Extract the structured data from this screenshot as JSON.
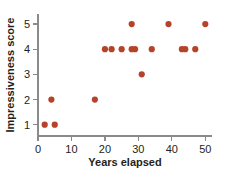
{
  "chart_data": {
    "type": "scatter",
    "title": "",
    "xlabel": "Years elapsed",
    "ylabel": "Impressiveness score",
    "xlim": [
      0,
      52
    ],
    "ylim": [
      0.55,
      5.4
    ],
    "xticks": [
      0,
      10,
      20,
      30,
      40,
      50
    ],
    "xtick_labels": [
      "0",
      "10",
      "20",
      "30",
      "40",
      "50"
    ],
    "yticks": [
      1,
      2,
      3,
      4,
      5
    ],
    "ytick_labels": [
      "1",
      "2",
      "3",
      "4",
      "5"
    ],
    "grid": false,
    "legend": false,
    "marker_color": "#b5432a",
    "marker_size": 3.1,
    "axis_color": "#8a8a8a",
    "text_color": "#231f20",
    "points": [
      {
        "x": 2,
        "y": 1
      },
      {
        "x": 5,
        "y": 1
      },
      {
        "x": 4,
        "y": 2
      },
      {
        "x": 17,
        "y": 2
      },
      {
        "x": 31,
        "y": 3
      },
      {
        "x": 20,
        "y": 4
      },
      {
        "x": 22,
        "y": 4
      },
      {
        "x": 25,
        "y": 4
      },
      {
        "x": 28,
        "y": 4
      },
      {
        "x": 29,
        "y": 4
      },
      {
        "x": 34,
        "y": 4
      },
      {
        "x": 43,
        "y": 4
      },
      {
        "x": 44,
        "y": 4
      },
      {
        "x": 47,
        "y": 4
      },
      {
        "x": 28,
        "y": 5
      },
      {
        "x": 39,
        "y": 5
      },
      {
        "x": 50,
        "y": 5
      }
    ]
  }
}
